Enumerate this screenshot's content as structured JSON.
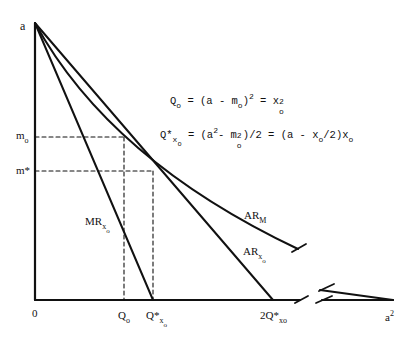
{
  "diagram": {
    "axes": {
      "y_top_label": "a",
      "origin_label": "0",
      "x_end_label_base": "a",
      "x_end_label_sup": "2"
    },
    "y_marks": {
      "m_o": {
        "base": "m",
        "sub": "o"
      },
      "m_star": "m*"
    },
    "x_marks": {
      "Q_o": {
        "base": "Q",
        "sub": "o"
      },
      "Q_star_xo": {
        "base": "Q*",
        "sub": "x",
        "subsub": "o"
      },
      "two_Q_star_xo": {
        "base": "2Q*",
        "sub": "xo"
      }
    },
    "curves": {
      "MR": {
        "base": "MR",
        "sub": "x",
        "subsub": "o"
      },
      "AR_xo": {
        "base": "AR",
        "sub": "x",
        "subsub": "o"
      },
      "AR_M": {
        "base": "AR",
        "sub": "M"
      }
    },
    "equations": [
      "Q_o = (a - m_o)^2 = x_o^2",
      "Q*_xo = (a^2 - m_o^2)/2 = (a - x_o/2)x_o"
    ],
    "eq1": {
      "lhs": "Q",
      "lhs_sub": "o",
      "p1": " = (a - m",
      "p1_sub": "o",
      "p2": ")",
      "p2_sup": "2",
      "p3": " = x",
      "p3_sub": "o",
      "p3_sup": "2"
    },
    "eq2": {
      "lhs": "Q*",
      "lhs_sub": "x",
      "lhs_subsub": "o",
      "p1": " = (a",
      "p1_sup": "2",
      "p2": "- m",
      "p2_sup": "2",
      "p2_sub": "o",
      "p3": ")/2 = (a - x",
      "p3_sub": "o",
      "p4": "/2)x",
      "p4_sub": "o"
    },
    "colors": {
      "line": "#111111",
      "background": "#ffffff"
    }
  }
}
